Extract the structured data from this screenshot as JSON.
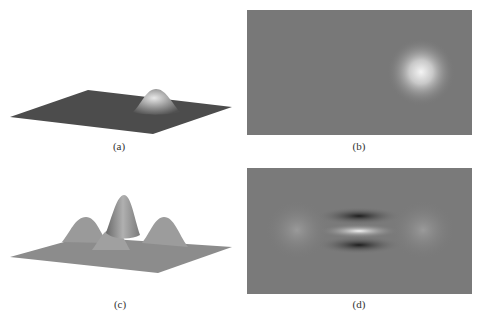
{
  "figure": {
    "panels": [
      {
        "id": "a",
        "caption": "(a)",
        "kind": "3d-surface",
        "description": "single gaussian bump on flat dark plane"
      },
      {
        "id": "b",
        "caption": "(b)",
        "kind": "intensity-image",
        "description": "bright gaussian spot right of center on gray"
      },
      {
        "id": "c",
        "caption": "(c)",
        "kind": "3d-surface",
        "description": "oscillating wavelet surface with central peak and negative lobes"
      },
      {
        "id": "d",
        "caption": "(d)",
        "kind": "intensity-image",
        "description": "horizontal dark-light-dark stripes at center with faint side lobes"
      }
    ],
    "colors": {
      "background": "#ffffff",
      "plane_dark": "#505050",
      "plane_gray": "#8a8a8a",
      "image_gray": "#7a7a7a",
      "highlight": "#f0f0f0"
    }
  }
}
